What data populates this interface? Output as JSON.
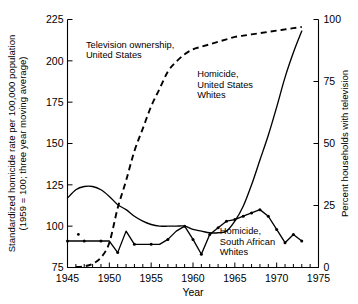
{
  "chart_data": {
    "type": "line",
    "title": "",
    "xlabel": "Year",
    "ylabel_left": "Standardized homicide rate per 100,000 population",
    "ylabel_left_2": "(1959 = 100; three year moving average)",
    "ylabel_right": "Percent households with television",
    "xlim": [
      1945,
      1975
    ],
    "ylim_left": [
      75,
      225
    ],
    "ylim_right": [
      0,
      100
    ],
    "xticks": [
      1945,
      1950,
      1955,
      1960,
      1965,
      1970,
      1975
    ],
    "xticklabels": [
      "1945",
      "1950",
      "1955",
      "1960",
      "1965",
      "1970",
      "1975"
    ],
    "xtick_minor_step": 1,
    "yticks_left": [
      75,
      100,
      125,
      150,
      175,
      200,
      225
    ],
    "yticklabels_left": [
      "75",
      "100",
      "125",
      "150",
      "175",
      "200",
      "225"
    ],
    "yticks_right": [
      0,
      25,
      50,
      75,
      100
    ],
    "yticklabels_right": [
      "0",
      "25",
      "50",
      "75",
      "100"
    ],
    "grid": false,
    "legend_position": "inline-annotations",
    "series": [
      {
        "name": "Television ownership, United States",
        "axis": "right",
        "style": "dashed",
        "markers": false,
        "x": [
          1946,
          1947,
          1948,
          1949,
          1950,
          1951,
          1952,
          1953,
          1954,
          1955,
          1956,
          1957,
          1958,
          1959,
          1960,
          1961,
          1962,
          1963,
          1964,
          1965,
          1966,
          1967,
          1968,
          1969,
          1970,
          1971,
          1972,
          1973
        ],
        "values": [
          0.2,
          0.5,
          1.5,
          4,
          10,
          24,
          35,
          47,
          56,
          65,
          72,
          79,
          83,
          86,
          88,
          89,
          90,
          91,
          92,
          93,
          93.5,
          94,
          94.5,
          95,
          95.5,
          96,
          96.5,
          97
        ]
      },
      {
        "name": "Homicide, United States Whites",
        "axis": "left",
        "style": "solid",
        "markers": false,
        "x": [
          1945,
          1946,
          1947,
          1948,
          1949,
          1950,
          1951,
          1952,
          1953,
          1954,
          1955,
          1956,
          1957,
          1958,
          1959,
          1960,
          1961,
          1962,
          1963,
          1964,
          1965,
          1966,
          1967,
          1968,
          1969,
          1970,
          1971,
          1972,
          1973
        ],
        "values": [
          117,
          122,
          124,
          124,
          122,
          118,
          113,
          110,
          106,
          103,
          101,
          100,
          100,
          100,
          100,
          98,
          97,
          96,
          96,
          97,
          103,
          112,
          125,
          140,
          155,
          172,
          190,
          205,
          218
        ]
      },
      {
        "name": "Homicide, South African Whites",
        "axis": "left",
        "style": "solid",
        "markers": true,
        "x": [
          1945,
          1946,
          1947,
          1948,
          1949,
          1950,
          1951,
          1952,
          1953,
          1954,
          1955,
          1956,
          1957,
          1958,
          1959,
          1960,
          1961,
          1962,
          1963,
          1964,
          1965,
          1966,
          1967,
          1968,
          1969,
          1970,
          1971,
          1972,
          1973
        ],
        "values": [
          91,
          91,
          91,
          91,
          91,
          91,
          84,
          97,
          89,
          89,
          89,
          89,
          92,
          97,
          100,
          92,
          83,
          95,
          99,
          103,
          104,
          106,
          108,
          110,
          106,
          98,
          90,
          95,
          91
        ]
      }
    ],
    "annotations": [
      {
        "name": "tv-ownership-label",
        "lines": [
          "Television ownership,",
          "United States"
        ],
        "x": 1947.2,
        "y_left": 208
      },
      {
        "name": "us-homicide-label",
        "lines": [
          "Homicide,",
          "United States",
          "Whites"
        ],
        "x": 1960.5,
        "y_left": 190
      },
      {
        "name": "sa-homicide-label",
        "lines": [
          "Homicide,",
          "South African",
          "Whites"
        ],
        "x": 1963.2,
        "y_left": 95
      }
    ],
    "stray_marker": {
      "x": 1946.3,
      "y_left": 95
    }
  }
}
